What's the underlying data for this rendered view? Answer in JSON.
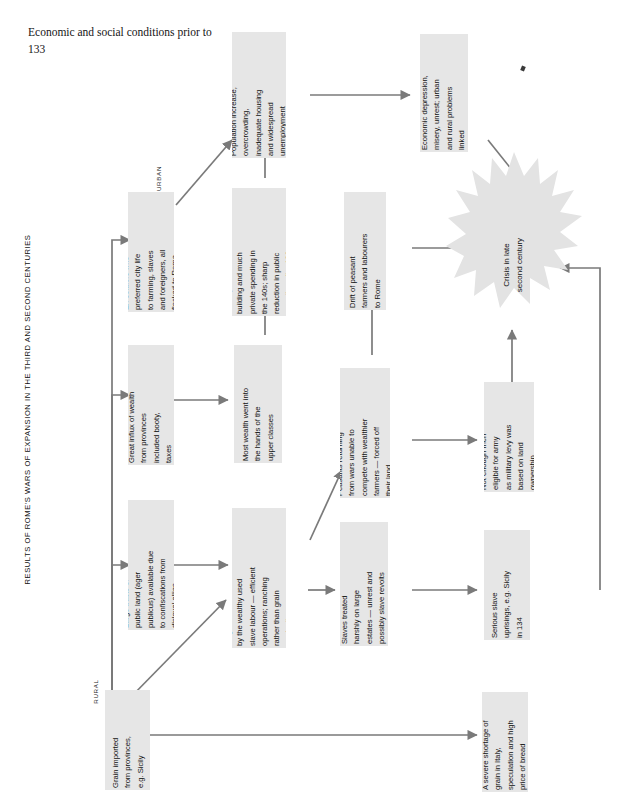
{
  "page": {
    "caption": "Economic and social conditions prior to 133",
    "figure_title_small": "RESULTS OF ",
    "figure_title_caps": "R",
    "figure_title": "RESULTS OF ROME'S WARS OF EXPANSION IN THE THIRD AND SECOND CENTURIES"
  },
  "sections": {
    "rural": "RURAL",
    "urban": "URBAN"
  },
  "colors": {
    "box_fill": "#e6e6e6",
    "arrow": "#7a7a7a",
    "burst_fill": "#e3e3e3",
    "text": "#121212"
  },
  "nodes": [
    {
      "id": "grain-imported",
      "text": "Grain imported\nfrom provinces,\ne.g. Sicily"
    },
    {
      "id": "public-land",
      "text": "Large tracts of\npublic land (ager\npublicus) available due\nto confiscations from\ndisloyal allies"
    },
    {
      "id": "influx-wealth",
      "text": "Great influx of wealth\nfrom provinces\nincluded booty,\ntaxes"
    },
    {
      "id": "ex-soldiers",
      "text": "Ex-soldiers who\npreferred city life\nto farming, slaves\nand foreigners, all\nflocked to Rome"
    },
    {
      "id": "large-estates",
      "text": "Large estates owned\nby the wealthy used\nslave labour — efficient\noperations; ranching\nrather than grain\nproduction"
    },
    {
      "id": "most-wealth",
      "text": "Most wealth went into\nthe hands of the\nupper classes"
    },
    {
      "id": "boom-period",
      "text": "Boom period in\nbuilding and much\nprivate spending in\nthe 140s; sharp\nreduction in public\nspending after 138"
    },
    {
      "id": "population",
      "text": "Population increase,\novercrowding,\ninadequate housing\nand widespread\nunemployment"
    },
    {
      "id": "slaves-treated",
      "text": "Slaves treated\nharshly on large\nestates — unrest and\npossibly slave revolts"
    },
    {
      "id": "peasants",
      "text": "Peasants returning\nfrom wars unable to\ncompete with wealthier\nfarmers — forced off\ntheir land"
    },
    {
      "id": "drift-peasant",
      "text": "Drift of peasant\nfarmers and labourers\nto Rome"
    },
    {
      "id": "econ-depression",
      "text": "Economic depression,\nmisery, unrest; urban\nand rural problems\nlinked"
    },
    {
      "id": "grain-shortage",
      "text": "A severe shortage of\ngrain in Italy,\nspeculation and high\nprice of bread"
    },
    {
      "id": "slave-uprisings",
      "text": "Serious slave\nuprisings, e.g. Sicily\nin 134"
    },
    {
      "id": "not-enough-men",
      "text": "Not enough men\neligible for army\nas military levy was\nbased on land\nownership"
    }
  ],
  "outcome": {
    "id": "crisis",
    "text": "Crisis in late\nsecond century"
  }
}
